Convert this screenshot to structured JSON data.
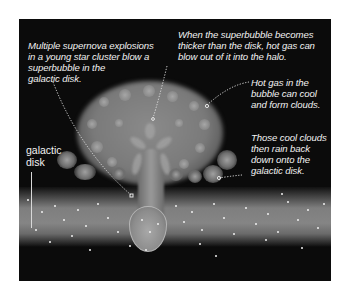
{
  "diagram": {
    "captions": {
      "supernova": [
        "Multiple supernova explosions",
        "in a young star cluster blow a",
        "superbubble in the",
        "galactic disk."
      ],
      "blowout": [
        "When the superbubble becomes",
        "thicker than the disk, hot gas can",
        "blow out of it into the halo."
      ],
      "cooling": [
        "Hot gas in the",
        "bubble can cool",
        "and form clouds."
      ],
      "rain": [
        "Those cool clouds",
        "then rain back",
        "down onto the",
        "galactic disk."
      ]
    },
    "disk_label": [
      "galactic",
      "disk"
    ],
    "colors": {
      "background": "#0b0b0b",
      "text": "#f2f2f2",
      "gas": "#8a8a8a",
      "disk": "#858585"
    }
  }
}
